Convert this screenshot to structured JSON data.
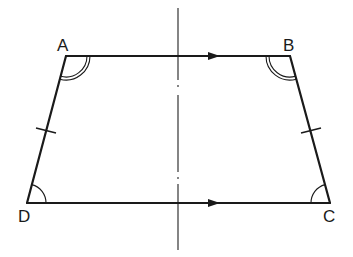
{
  "diagram": {
    "type": "isosceles-trapezoid",
    "stroke_color": "#1a1a1a",
    "vertices": {
      "A": {
        "label": "A",
        "x": 66,
        "y": 56
      },
      "B": {
        "label": "B",
        "x": 290,
        "y": 56
      },
      "C": {
        "label": "C",
        "x": 330,
        "y": 203
      },
      "D": {
        "label": "D",
        "x": 27,
        "y": 203
      }
    },
    "parallel_sides": [
      "AB",
      "DC"
    ],
    "equal_sides": [
      "AD",
      "BC"
    ],
    "angle_marks": {
      "A": "double-arc",
      "B": "double-arc",
      "C": "single-arc",
      "D": "single-arc"
    },
    "axis_of_symmetry": {
      "style": "dash-dot",
      "x": 178
    }
  }
}
